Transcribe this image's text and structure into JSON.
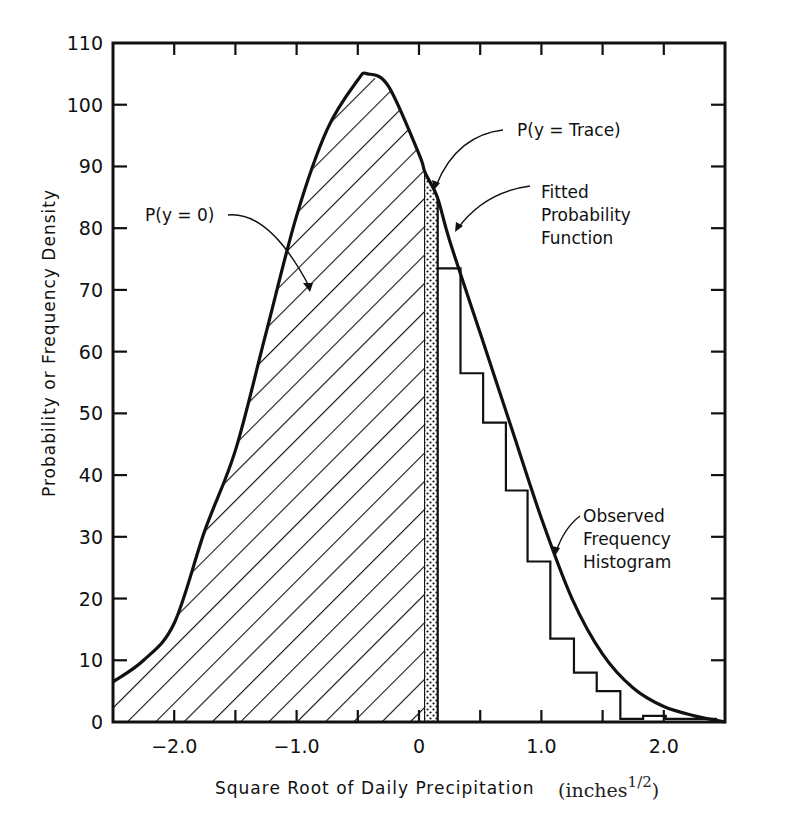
{
  "chart_data": {
    "type": "line",
    "title": "",
    "xlabel": "Square Root of Daily Precipitation",
    "xlabel_units": "(inches",
    "xlabel_units_sup": "1/2",
    "xlabel_units_close": ")",
    "ylabel": "Probability or Frequency Density",
    "xlim": [
      -2.5,
      2.5
    ],
    "ylim": [
      0,
      110
    ],
    "x_ticks": [
      -2.0,
      -1.5,
      -1.0,
      -0.5,
      0,
      0.5,
      1.0,
      1.5,
      2.0
    ],
    "x_tick_labels": [
      {
        "x": -2.0,
        "label": "-2.0"
      },
      {
        "x": -1.0,
        "label": "-1.0"
      },
      {
        "x": 0,
        "label": "0"
      },
      {
        "x": 1.0,
        "label": "1.0"
      },
      {
        "x": 2.0,
        "label": "2.0"
      }
    ],
    "y_ticks": [
      0,
      10,
      20,
      30,
      40,
      50,
      60,
      70,
      80,
      90,
      100,
      110
    ],
    "y_tick_labels": [
      "0",
      "10",
      "20",
      "30",
      "40",
      "50",
      "60",
      "70",
      "80",
      "90",
      "100",
      "110"
    ],
    "grid": false,
    "series": [
      {
        "name": "Fitted Probability Function",
        "type": "line",
        "x": [
          -2.5,
          -2.25,
          -2.0,
          -1.75,
          -1.5,
          -1.25,
          -1.0,
          -0.75,
          -0.5,
          -0.42,
          -0.25,
          0.0,
          0.05,
          0.15,
          0.25,
          0.5,
          0.75,
          1.0,
          1.25,
          1.5,
          1.75,
          2.0,
          2.25,
          2.5
        ],
        "y": [
          6.5,
          10,
          16,
          31,
          44,
          63,
          82,
          96,
          104,
          105,
          103,
          92,
          89,
          85,
          78,
          63,
          48,
          33,
          20,
          11,
          5.5,
          2.5,
          1,
          0
        ]
      },
      {
        "name": "Observed Frequency Histogram",
        "type": "histogram",
        "bin_edges": [
          0.153,
          0.339,
          0.524,
          0.71,
          0.887,
          1.073,
          1.266,
          1.452,
          1.645,
          1.831,
          2.016,
          2.435
        ],
        "values": [
          73.5,
          56.5,
          48.5,
          37.5,
          26,
          13.5,
          8,
          5,
          0.5,
          1,
          0.5
        ]
      }
    ],
    "shaded_regions": [
      {
        "name": "P(y=0)",
        "pattern": "diagonal-hatch",
        "x_range": [
          -2.5,
          0.05
        ]
      },
      {
        "name": "P(y=Trace)",
        "pattern": "stipple",
        "x_range": [
          0.05,
          0.153
        ]
      }
    ],
    "annotations": [
      {
        "text": "P(y = 0)",
        "target": "hatched region under curve left of 0"
      },
      {
        "text": "P(y = Trace)",
        "target": "stippled narrow band just right of 0"
      },
      {
        "text": "Fitted Probability Function",
        "lines": [
          "Fitted",
          "Probability",
          "Function"
        ],
        "target": "fitted curve"
      },
      {
        "text": "Observed Frequency Histogram",
        "lines": [
          "Observed",
          "Frequency",
          "Histogram"
        ],
        "target": "histogram steps"
      }
    ]
  },
  "labels": {
    "p_zero": "P(y = 0)",
    "p_trace": "P(y = Trace)",
    "fitted_1": "Fitted",
    "fitted_2": "Probability",
    "fitted_3": "Function",
    "observed_1": "Observed",
    "observed_2": "Frequency",
    "observed_3": "Histogram"
  }
}
